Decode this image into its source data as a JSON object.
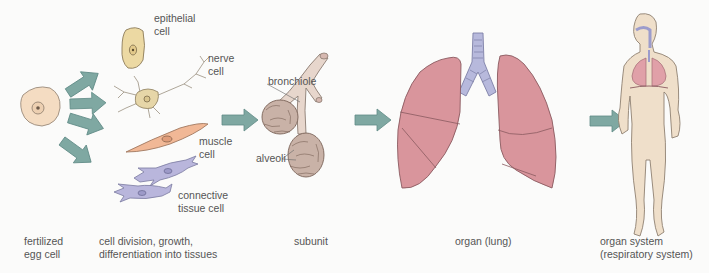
{
  "diagram": {
    "colors": {
      "arrow": "#7fa8a2",
      "arrow_stroke": "#5f8a85",
      "egg_cell": "#f4dcc2",
      "epithelial_cell": "#ecd9a3",
      "nerve_cell": "#e6d6a8",
      "muscle_cell": "#f1b896",
      "connective_tissue": "#b9b6dc",
      "alveoli": "#c9b2a7",
      "bronchiole": "#e7d6cc",
      "lung": "#d9959c",
      "trachea": "#b7b9dc",
      "body": "#efdfca"
    },
    "cell_labels": {
      "epithelial": "epithelial\ncell",
      "nerve": "nerve\ncell",
      "muscle": "muscle\ncell",
      "connective": "connective\ntissue cell"
    },
    "subunit_labels": {
      "bronchiole": "bronchiole",
      "alveoli": "alveoli"
    },
    "captions": {
      "egg": "fertilized\negg cell",
      "tissues": "cell division, growth,\ndifferentiation into tissues",
      "subunit": "subunit",
      "organ": "organ (lung)",
      "system": "organ system\n(respiratory system)"
    }
  }
}
